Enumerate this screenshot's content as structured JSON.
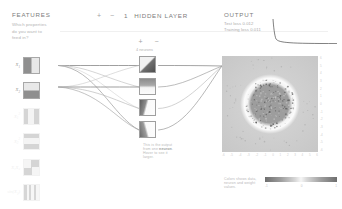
{
  "features": {
    "title": "FEATURES",
    "description": "Which properties do you want to feed in?",
    "items": [
      {
        "label": "X",
        "sub": "1",
        "sup": "",
        "pattern": "pat-vert",
        "active": true
      },
      {
        "label": "X",
        "sub": "2",
        "sup": "",
        "pattern": "pat-horz",
        "active": true
      },
      {
        "label": "X",
        "sub": "1",
        "sup": "2",
        "pattern": "pat-vsq",
        "active": false
      },
      {
        "label": "X",
        "sub": "2",
        "sup": "2",
        "pattern": "pat-hsq",
        "active": false
      },
      {
        "label": "X₁X₂",
        "sub": "",
        "sup": "",
        "pattern": "pat-quad",
        "active": false
      },
      {
        "label": "sin(X",
        "sub": "1",
        "sup": "",
        "pattern": "pat-sinv",
        "active": false
      },
      {
        "label": "sin(X",
        "sub": "2",
        "sup": "",
        "pattern": "pat-sinh",
        "active": false
      }
    ]
  },
  "layer_header": {
    "add_label": "+",
    "remove_label": "−",
    "count": "1",
    "word": "HIDDEN LAYER"
  },
  "hidden_layer": {
    "add_label": "+",
    "remove_label": "−",
    "neuron_count_label": "4 neurons",
    "neurons": [
      {
        "name": "hidden-neuron-1",
        "pattern": "n-diag1"
      },
      {
        "name": "hidden-neuron-2",
        "pattern": "n-diag2"
      },
      {
        "name": "hidden-neuron-3",
        "pattern": "n-diag3"
      },
      {
        "name": "hidden-neuron-4",
        "pattern": "n-diag4"
      }
    ],
    "note_part1": "This is the output from one ",
    "note_bold": "neuron",
    "note_part2": ". Hover to see it larger."
  },
  "output": {
    "title": "OUTPUT",
    "test_loss": "Test loss 0.012",
    "training_loss": "Training loss 0.011",
    "x_ticks": [
      "-6",
      "-5",
      "-4",
      "-3",
      "-2",
      "-1",
      "0",
      "1",
      "2",
      "3",
      "4",
      "5",
      "6"
    ],
    "y_ticks": [
      "-6",
      "-5",
      "-4",
      "-3",
      "-2",
      "-1",
      "0",
      "1",
      "2",
      "3",
      "4",
      "5",
      "6"
    ]
  },
  "legend": {
    "text": "Colors shows data, neuron and weight values.",
    "min": "-1",
    "mid": "0",
    "max": "1"
  },
  "colors": {
    "negative": "#6e6e6e",
    "neutral": "#f6f6f6",
    "positive": "#6e6e6e",
    "text": "#8a8a8a",
    "muted": "#b9b9b9"
  }
}
